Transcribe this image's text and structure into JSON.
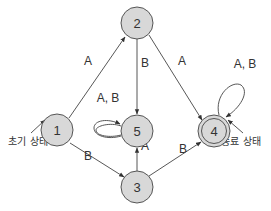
{
  "diagram": {
    "type": "state-transition-diagram",
    "nodes": [
      {
        "id": "1",
        "label": "1",
        "initial": true,
        "accepting": false
      },
      {
        "id": "2",
        "label": "2",
        "initial": false,
        "accepting": false
      },
      {
        "id": "3",
        "label": "3",
        "initial": false,
        "accepting": false
      },
      {
        "id": "4",
        "label": "4",
        "initial": false,
        "accepting": true
      },
      {
        "id": "5",
        "label": "5",
        "initial": false,
        "accepting": false
      }
    ],
    "edges": [
      {
        "from": "1",
        "to": "2",
        "label": "A"
      },
      {
        "from": "1",
        "to": "3",
        "label": "B"
      },
      {
        "from": "2",
        "to": "5",
        "label": "B"
      },
      {
        "from": "2",
        "to": "4",
        "label": "A"
      },
      {
        "from": "3",
        "to": "5",
        "label": "A"
      },
      {
        "from": "3",
        "to": "4",
        "label": "B"
      },
      {
        "from": "5",
        "to": "5",
        "label": "A, B"
      },
      {
        "from": "4",
        "to": "4",
        "label": "A, B"
      }
    ],
    "annotations": {
      "initial_state": "초기 상태",
      "final_state": "종료 상태"
    }
  }
}
